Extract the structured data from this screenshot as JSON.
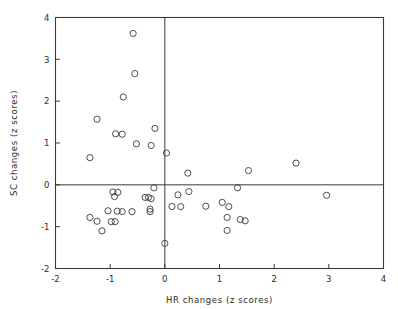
{
  "chart_data": {
    "type": "scatter",
    "title": "",
    "xlabel": "HR changes (z scores)",
    "ylabel": "SC changes (z scores)",
    "xlim": [
      -2,
      4
    ],
    "ylim": [
      -2,
      4
    ],
    "xticks": [
      -2,
      -1,
      0,
      1,
      2,
      3,
      4
    ],
    "yticks": [
      -2,
      -1,
      0,
      1,
      2,
      3,
      4
    ],
    "xtick_labels": [
      "-2",
      "-1",
      "0",
      "1",
      "2",
      "3",
      "4"
    ],
    "ytick_labels": [
      "-2",
      "-1",
      "0",
      "1",
      "2",
      "3",
      "4"
    ],
    "grid": false,
    "legend": null,
    "reference_lines": [
      {
        "axis": "x",
        "value": 0
      },
      {
        "axis": "y",
        "value": 0
      }
    ],
    "marker": {
      "shape": "open-circle",
      "radius": 3.1,
      "stroke": "#3a3a3a",
      "fill": "none"
    },
    "points": [
      {
        "x": -0.58,
        "y": 3.62
      },
      {
        "x": -0.55,
        "y": 2.66
      },
      {
        "x": -0.76,
        "y": 2.1
      },
      {
        "x": -1.24,
        "y": 1.57
      },
      {
        "x": -0.18,
        "y": 1.35
      },
      {
        "x": -0.9,
        "y": 1.22
      },
      {
        "x": -0.78,
        "y": 1.21
      },
      {
        "x": -0.52,
        "y": 0.98
      },
      {
        "x": -0.25,
        "y": 0.94
      },
      {
        "x": 0.03,
        "y": 0.76
      },
      {
        "x": -1.37,
        "y": 0.65
      },
      {
        "x": 2.4,
        "y": 0.52
      },
      {
        "x": 1.53,
        "y": 0.34
      },
      {
        "x": 0.42,
        "y": 0.28
      },
      {
        "x": -0.2,
        "y": -0.07
      },
      {
        "x": 1.33,
        "y": -0.07
      },
      {
        "x": 0.44,
        "y": -0.16
      },
      {
        "x": -0.95,
        "y": -0.17
      },
      {
        "x": -0.86,
        "y": -0.18
      },
      {
        "x": 0.24,
        "y": -0.24
      },
      {
        "x": 2.96,
        "y": -0.25
      },
      {
        "x": -0.92,
        "y": -0.28
      },
      {
        "x": -0.36,
        "y": -0.3
      },
      {
        "x": -0.3,
        "y": -0.3
      },
      {
        "x": -0.25,
        "y": -0.33
      },
      {
        "x": 1.05,
        "y": -0.42
      },
      {
        "x": 0.75,
        "y": -0.51
      },
      {
        "x": 0.13,
        "y": -0.52
      },
      {
        "x": 0.29,
        "y": -0.52
      },
      {
        "x": 1.17,
        "y": -0.52
      },
      {
        "x": -0.27,
        "y": -0.58
      },
      {
        "x": -0.27,
        "y": -0.64
      },
      {
        "x": -0.6,
        "y": -0.64
      },
      {
        "x": -0.87,
        "y": -0.63
      },
      {
        "x": -0.78,
        "y": -0.64
      },
      {
        "x": -1.04,
        "y": -0.62
      },
      {
        "x": 1.14,
        "y": -0.78
      },
      {
        "x": -1.37,
        "y": -0.78
      },
      {
        "x": 1.38,
        "y": -0.83
      },
      {
        "x": 1.47,
        "y": -0.86
      },
      {
        "x": -1.24,
        "y": -0.87
      },
      {
        "x": -0.98,
        "y": -0.88
      },
      {
        "x": -0.91,
        "y": -0.88
      },
      {
        "x": -1.15,
        "y": -1.1
      },
      {
        "x": 1.14,
        "y": -1.09
      },
      {
        "x": 0.0,
        "y": -1.4
      }
    ]
  },
  "axes": {
    "x_title": "HR changes (z scores)",
    "y_title": "SC changes (z scores)"
  }
}
